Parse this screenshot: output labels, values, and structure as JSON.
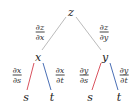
{
  "diagram": {
    "nodes": {
      "root": {
        "label": "z",
        "x": 71,
        "y": 12
      },
      "mid_left": {
        "label": "x",
        "x": 38,
        "y": 56
      },
      "mid_right": {
        "label": "y",
        "x": 105,
        "y": 56
      },
      "leaf_ll": {
        "label": "s",
        "x": 26,
        "y": 97
      },
      "leaf_lr": {
        "label": "t",
        "x": 52,
        "y": 97
      },
      "leaf_rl": {
        "label": "s",
        "x": 90,
        "y": 97
      },
      "leaf_rr": {
        "label": "t",
        "x": 119,
        "y": 97
      }
    },
    "edge_labels": {
      "dz_dx": {
        "num": "∂z",
        "den": "∂x"
      },
      "dz_dy": {
        "num": "∂z",
        "den": "∂y"
      },
      "dx_ds": {
        "num": "∂x",
        "den": "∂s"
      },
      "dx_dt": {
        "num": "∂x",
        "den": "∂t"
      },
      "dy_ds": {
        "num": "∂y",
        "den": "∂s"
      },
      "dy_dt": {
        "num": "∂y",
        "den": "∂t"
      }
    },
    "colors": {
      "upper_edge": "#bbbbbb",
      "s_edge": "#d9535f",
      "t_edge": "#4a6fb5"
    }
  }
}
